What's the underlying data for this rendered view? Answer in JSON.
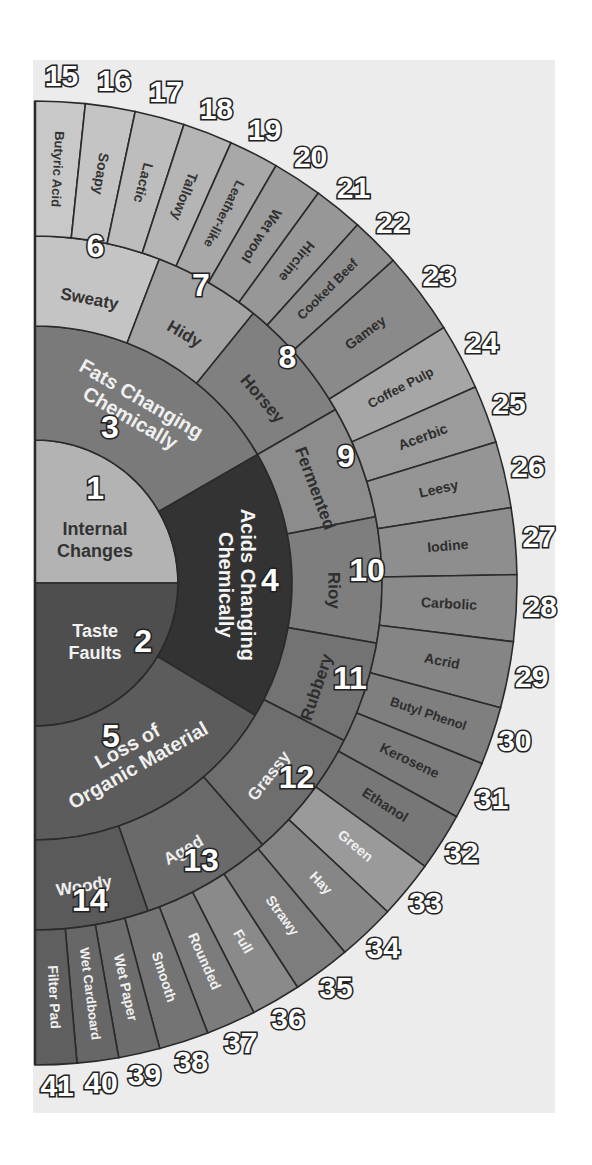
{
  "geometry": {
    "center": [
      35,
      583
    ],
    "radii": [
      0,
      143,
      257,
      347,
      482
    ],
    "angle_range": [
      -90,
      90
    ]
  },
  "colors": {
    "background_panel": "#ececec",
    "outline": "#2a2a2a",
    "number_fill": "#ffffff",
    "number_stroke": "#222222"
  },
  "rings": [
    {
      "level": 1,
      "segments": [
        {
          "id": 1,
          "label": "Internal Changes",
          "lines": [
            "Internal",
            "Changes"
          ],
          "start": -90,
          "end": 0,
          "fill": "#b3b3b3",
          "text": "#333333"
        },
        {
          "id": 2,
          "label": "Taste Faults",
          "lines": [
            "Taste",
            "Faults"
          ],
          "start": 0,
          "end": 90,
          "fill": "#4e4e4e",
          "text": "#f2f2f2"
        }
      ]
    },
    {
      "level": 2,
      "segments": [
        {
          "id": 3,
          "label": "Fats Changing Chemically",
          "lines": [
            "Fats Changing",
            "Chemically"
          ],
          "start": -90,
          "end": -30,
          "fill": "#7a7a7a",
          "text": "#f0f0f0"
        },
        {
          "id": 4,
          "label": "Acids Changing Chemically",
          "lines": [
            "Acids Changing",
            "Chemically"
          ],
          "start": -30,
          "end": 31,
          "fill": "#333333",
          "text": "#f5f5f5"
        },
        {
          "id": 5,
          "label": "Loss of Organic Material",
          "lines": [
            "Loss of",
            "Organic Material"
          ],
          "start": 31,
          "end": 90,
          "fill": "#5c5c5c",
          "text": "#f0f0f0"
        }
      ]
    },
    {
      "level": 3,
      "segments": [
        {
          "id": 6,
          "label": "Sweaty",
          "start": -90,
          "end": -69,
          "fill": "#c4c4c4",
          "text": "#333333"
        },
        {
          "id": 7,
          "label": "Hidy",
          "start": -69,
          "end": -51,
          "fill": "#a3a3a3",
          "text": "#333333"
        },
        {
          "id": 8,
          "label": "Horsey",
          "start": -51,
          "end": -30,
          "fill": "#808080",
          "text": "#2e2e2e"
        },
        {
          "id": 9,
          "label": "Fermented",
          "start": -30,
          "end": -11,
          "fill": "#8c8c8c",
          "text": "#2e2e2e"
        },
        {
          "id": 10,
          "label": "Rioy",
          "start": -11,
          "end": 10,
          "fill": "#7e7e7e",
          "text": "#2e2e2e"
        },
        {
          "id": 11,
          "label": "Rubbery",
          "start": 10,
          "end": 27,
          "fill": "#737373",
          "text": "#2e2e2e"
        },
        {
          "id": 12,
          "label": "Grassy",
          "start": 27,
          "end": 49,
          "fill": "#6e6e6e",
          "text": "#eeeeee"
        },
        {
          "id": 13,
          "label": "Aged",
          "start": 49,
          "end": 71,
          "fill": "#6a6a6a",
          "text": "#eeeeee"
        },
        {
          "id": 14,
          "label": "Woody",
          "start": 71,
          "end": 90,
          "fill": "#5a5a5a",
          "text": "#eeeeee"
        }
      ]
    },
    {
      "level": 4,
      "segments": [
        {
          "id": 15,
          "label": "Butyric Acid",
          "start": -90,
          "end": -84,
          "fill": "#c8c8c8",
          "text": "#333333"
        },
        {
          "id": 16,
          "label": "Soapy",
          "start": -84,
          "end": -78,
          "fill": "#c4c4c4",
          "text": "#333333"
        },
        {
          "id": 17,
          "label": "Lactic",
          "start": -78,
          "end": -72,
          "fill": "#bdbdbd",
          "text": "#333333"
        },
        {
          "id": 18,
          "label": "Tallowy",
          "start": -72,
          "end": -66,
          "fill": "#b5b5b5",
          "text": "#333333"
        },
        {
          "id": 19,
          "label": "Leather-like",
          "start": -66,
          "end": -60,
          "fill": "#a8a8a8",
          "text": "#333333"
        },
        {
          "id": 20,
          "label": "Wet wool",
          "start": -60,
          "end": -54,
          "fill": "#9c9c9c",
          "text": "#2e2e2e"
        },
        {
          "id": 21,
          "label": "Hircine",
          "start": -54,
          "end": -48,
          "fill": "#979797",
          "text": "#2e2e2e"
        },
        {
          "id": 22,
          "label": "Cooked Beef",
          "start": -48,
          "end": -42,
          "fill": "#8f8f8f",
          "text": "#2e2e2e"
        },
        {
          "id": 23,
          "label": "Gamey",
          "start": -42,
          "end": -32,
          "fill": "#8a8a8a",
          "text": "#2e2e2e"
        },
        {
          "id": 24,
          "label": "Coffee Pulp",
          "start": -32,
          "end": -24,
          "fill": "#a6a6a6",
          "text": "#2e2e2e"
        },
        {
          "id": 25,
          "label": "Acerbic",
          "start": -24,
          "end": -17,
          "fill": "#9b9b9b",
          "text": "#2e2e2e"
        },
        {
          "id": 26,
          "label": "Leesy",
          "start": -17,
          "end": -9,
          "fill": "#959595",
          "text": "#2e2e2e"
        },
        {
          "id": 27,
          "label": "Iodine",
          "start": -9,
          "end": -1,
          "fill": "#8e8e8e",
          "text": "#2e2e2e"
        },
        {
          "id": 28,
          "label": "Carbolic",
          "start": -1,
          "end": 7,
          "fill": "#8a8a8a",
          "text": "#2e2e2e"
        },
        {
          "id": 29,
          "label": "Acrid",
          "start": 7,
          "end": 15,
          "fill": "#858585",
          "text": "#2e2e2e"
        },
        {
          "id": 30,
          "label": "Butyl Phenol",
          "start": 15,
          "end": 22,
          "fill": "#7f7f7f",
          "text": "#2e2e2e"
        },
        {
          "id": 31,
          "label": "Kerosene",
          "start": 22,
          "end": 29,
          "fill": "#7b7b7b",
          "text": "#2e2e2e"
        },
        {
          "id": 32,
          "label": "Ethanol",
          "start": 29,
          "end": 36,
          "fill": "#777777",
          "text": "#2e2e2e"
        },
        {
          "id": 33,
          "label": "Green",
          "start": 36,
          "end": 43,
          "fill": "#9a9a9a",
          "text": "#f0f0f0"
        },
        {
          "id": 34,
          "label": "Hay",
          "start": 43,
          "end": 50,
          "fill": "#868686",
          "text": "#f0f0f0"
        },
        {
          "id": 35,
          "label": "Strawy",
          "start": 50,
          "end": 57,
          "fill": "#7d7d7d",
          "text": "#f0f0f0"
        },
        {
          "id": 36,
          "label": "Full",
          "start": 57,
          "end": 63,
          "fill": "#8a8a8a",
          "text": "#f0f0f0"
        },
        {
          "id": 37,
          "label": "Rounded",
          "start": 63,
          "end": 69,
          "fill": "#7c7c7c",
          "text": "#f0f0f0"
        },
        {
          "id": 38,
          "label": "Smooth",
          "start": 69,
          "end": 75,
          "fill": "#747474",
          "text": "#f0f0f0"
        },
        {
          "id": 39,
          "label": "Wet Paper",
          "start": 75,
          "end": 80,
          "fill": "#6d6d6d",
          "text": "#f0f0f0"
        },
        {
          "id": 40,
          "label": "Wet Cardboard",
          "start": 80,
          "end": 85,
          "fill": "#676767",
          "text": "#f0f0f0"
        },
        {
          "id": 41,
          "label": "Filter Pad",
          "start": 85,
          "end": 90,
          "fill": "#5f5f5f",
          "text": "#f0f0f0"
        }
      ]
    }
  ]
}
